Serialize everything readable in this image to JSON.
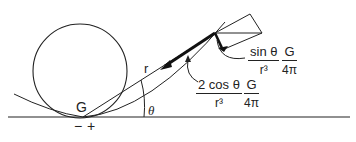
{
  "diagram": {
    "labels": {
      "G": "G",
      "r": "r",
      "theta": "θ",
      "minus": "−",
      "plus": "+"
    },
    "sin_component": {
      "numerator": "sin θ",
      "denominator": "r³",
      "factor_num": "G",
      "factor_den": "4π"
    },
    "radial_component": {
      "numerator": "2 cos θ",
      "denominator": "r³",
      "factor_num": "G",
      "factor_den": "4π"
    }
  }
}
